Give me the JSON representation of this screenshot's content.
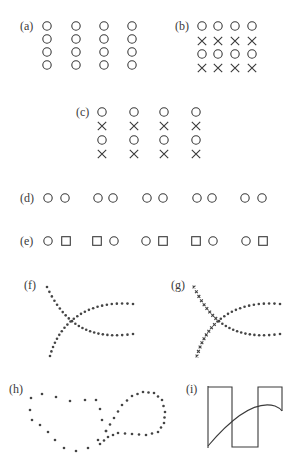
{
  "figure": {
    "ink_color": "#3a3a3a",
    "background": "#ffffff",
    "panels": [
      {
        "id": "a",
        "label": "(a)",
        "principle": "uniform grid of circles",
        "content": "4x4 circles, columns spaced widely"
      },
      {
        "id": "b",
        "label": "(b)",
        "principle": "similarity rows",
        "content": "rows: O O O O / X X X X / O O O O / X X X X"
      },
      {
        "id": "c",
        "label": "(c)",
        "principle": "proximity columns vs similarity rows",
        "content": "columns of O X O X, widely spaced"
      },
      {
        "id": "d",
        "label": "(d)",
        "principle": "proximity pairs",
        "content": "five pairs of circles"
      },
      {
        "id": "e",
        "label": "(e)",
        "principle": "proximity vs similarity",
        "content": "pairs: O□ □O O□ □O O□"
      },
      {
        "id": "f",
        "label": "(f)",
        "principle": "good continuation",
        "content": "two crossing dotted curves"
      },
      {
        "id": "g",
        "label": "(g)",
        "principle": "continuation with mixed markers",
        "content": "crossing curves with x-marks and dots"
      },
      {
        "id": "h",
        "label": "(h)",
        "principle": "closure",
        "content": "two dotted closed loops touching"
      },
      {
        "id": "i",
        "label": "(i)",
        "principle": "continuation across square wave",
        "content": "square wave with smooth curve"
      }
    ],
    "rows_b": [
      "OOOO",
      "XXXX",
      "OOOO",
      "XXXX"
    ],
    "rows_c": [
      "O",
      "X",
      "O",
      "X"
    ],
    "pairs_e": [
      "OS",
      "SO",
      "OS",
      "SO",
      "OS"
    ]
  }
}
